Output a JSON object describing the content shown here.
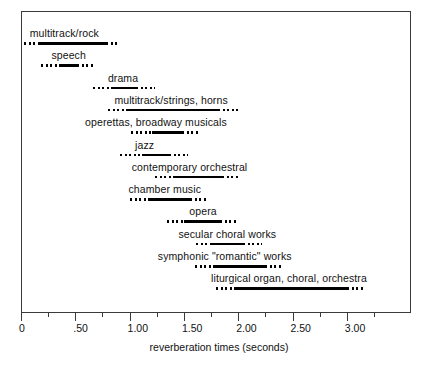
{
  "chart_data": {
    "type": "bar",
    "title": "",
    "subtitle": "",
    "xlabel": "reverberation times (seconds)",
    "ylabel": "",
    "xlim": [
      0,
      3.45
    ],
    "grid": false,
    "legend": null,
    "orientation": "horizontal",
    "note": "Each row is a floating range bar: a solid segment shows the typical/optimum reverberation-time range, with dotted extensions at each end showing the acceptable tolerance range.",
    "axis": {
      "tick_values": [
        0,
        0.25,
        0.5,
        0.75,
        1.0,
        1.25,
        1.5,
        1.75,
        2.0,
        2.25,
        2.5,
        2.75,
        3.0,
        3.25
      ],
      "labeled_ticks": [
        {
          "value": 0,
          "label": "0"
        },
        {
          "value": 0.5,
          "label": ".50"
        },
        {
          "value": 1.0,
          "label": "1.00"
        },
        {
          "value": 1.5,
          "label": "1.50"
        },
        {
          "value": 2.0,
          "label": "2.00"
        },
        {
          "value": 2.5,
          "label": "2.50"
        },
        {
          "value": 3.0,
          "label": "3.00"
        }
      ],
      "minor_tick_values": [
        0.25,
        0.75,
        1.25,
        1.75,
        2.25,
        2.75,
        3.25
      ],
      "units": "seconds"
    },
    "categories": [
      "multitrack/rock",
      "speech",
      "drama",
      "multitrack/strings, horns",
      "operettas, broadway musicals",
      "jazz",
      "contemporary orchestral",
      "chamber music",
      "opera",
      "secular choral works",
      "symphonic \"romantic\" works",
      "liturgical organ, choral, orchestra"
    ],
    "rows": [
      {
        "label": "multitrack/rock",
        "dotted_start": 0.03,
        "solid_start": 0.16,
        "solid_end": 0.78,
        "dotted_end": 0.89,
        "label_x": 0.08
      },
      {
        "label": "speech",
        "dotted_start": 0.18,
        "solid_start": 0.36,
        "solid_end": 0.52,
        "dotted_end": 0.67,
        "label_x": 0.28
      },
      {
        "label": "drama",
        "dotted_start": 0.66,
        "solid_start": 0.83,
        "solid_end": 1.06,
        "dotted_end": 1.23,
        "label_x": 0.8
      },
      {
        "label": "multitrack/strings, horns",
        "dotted_start": 0.8,
        "solid_start": 0.98,
        "solid_end": 1.81,
        "dotted_end": 2.0,
        "label_x": 0.86
      },
      {
        "label": "operettas, broadway musicals",
        "dotted_start": 1.01,
        "solid_start": 1.21,
        "solid_end": 1.48,
        "dotted_end": 1.65,
        "label_x": 0.59
      },
      {
        "label": "jazz",
        "dotted_start": 0.91,
        "solid_start": 1.11,
        "solid_end": 1.36,
        "dotted_end": 1.54,
        "label_x": 1.05
      },
      {
        "label": "contemporary orchestral",
        "dotted_start": 1.23,
        "solid_start": 1.42,
        "solid_end": 1.85,
        "dotted_end": 2.02,
        "label_x": 1.02
      },
      {
        "label": "chamber music",
        "dotted_start": 1.0,
        "solid_start": 1.19,
        "solid_end": 1.56,
        "dotted_end": 1.71,
        "label_x": 0.99
      },
      {
        "label": "opera",
        "dotted_start": 1.34,
        "solid_start": 1.5,
        "solid_end": 1.83,
        "dotted_end": 2.0,
        "label_x": 1.55
      },
      {
        "label": "secular choral works",
        "dotted_start": 1.61,
        "solid_start": 1.76,
        "solid_end": 2.04,
        "dotted_end": 2.22,
        "label_x": 1.45
      },
      {
        "label": "symphonic \"romantic\" works",
        "dotted_start": 1.6,
        "solid_start": 1.77,
        "solid_end": 2.25,
        "dotted_end": 2.4,
        "label_x": 1.26
      },
      {
        "label": "liturgical organ, choral, orchestra",
        "dotted_start": 1.8,
        "solid_start": 1.97,
        "solid_end": 3.0,
        "dotted_end": 3.17,
        "label_x": 1.75
      }
    ]
  }
}
